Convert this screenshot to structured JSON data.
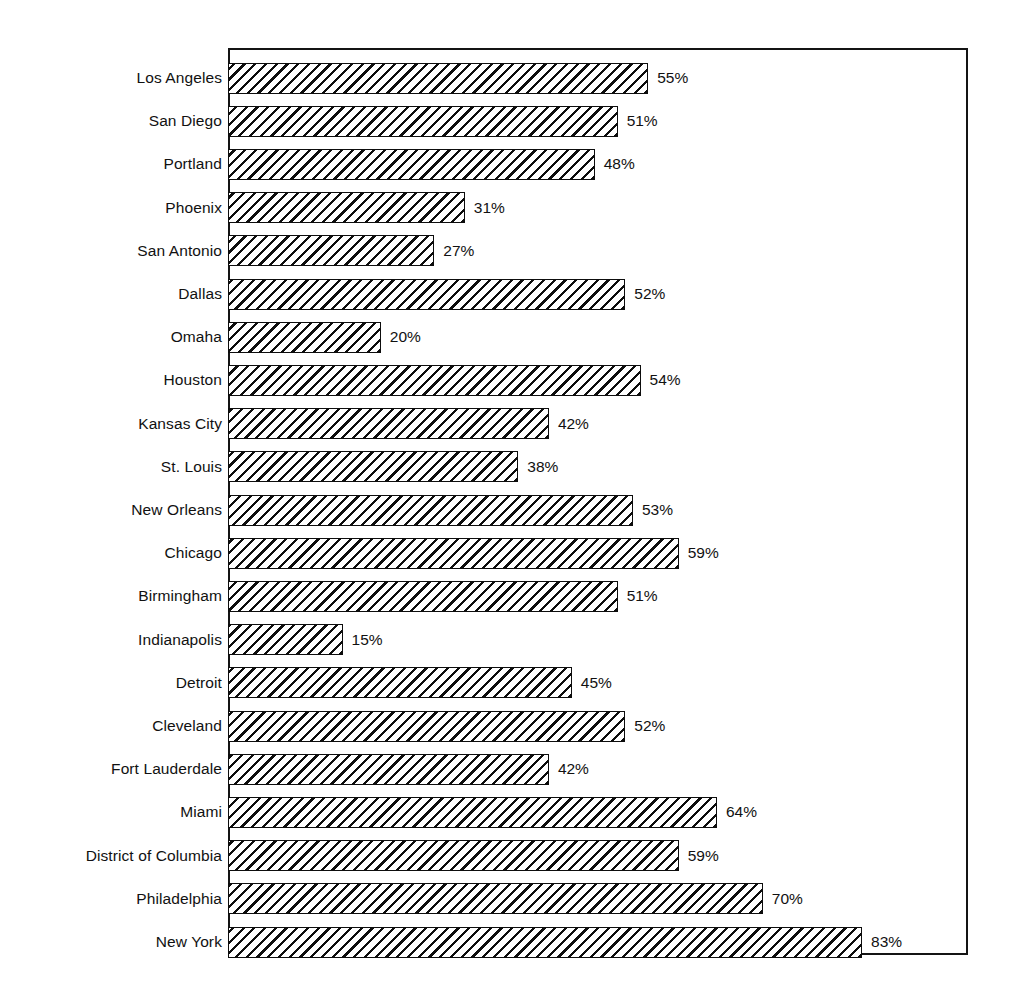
{
  "chart_data": {
    "type": "bar",
    "orientation": "horizontal",
    "title": "",
    "subtitle": "",
    "xlabel": "",
    "ylabel": "",
    "xlim": [
      0,
      100
    ],
    "grid": false,
    "legend": null,
    "value_suffix": "%",
    "categories": [
      "Los Angeles",
      "San Diego",
      "Portland",
      "Phoenix",
      "San Antonio",
      "Dallas",
      "Omaha",
      "Houston",
      "Kansas City",
      "St. Louis",
      "New Orleans",
      "Chicago",
      "Birmingham",
      "Indianapolis",
      "Detroit",
      "Cleveland",
      "Fort Lauderdale",
      "Miami",
      "District of Columbia",
      "Philadelphia",
      "New York"
    ],
    "values": [
      55,
      51,
      48,
      31,
      27,
      52,
      20,
      54,
      42,
      38,
      53,
      59,
      51,
      15,
      45,
      52,
      42,
      64,
      59,
      70,
      83
    ],
    "data_labels": [
      "55%",
      "51%",
      "48%",
      "31%",
      "27%",
      "52%",
      "20%",
      "54%",
      "42%",
      "38%",
      "53%",
      "59%",
      "51%",
      "15%",
      "45%",
      "52%",
      "42%",
      "64%",
      "59%",
      "70%",
      "83%"
    ],
    "bars": [
      {
        "label": "Los Angeles",
        "value": 55,
        "text": "55%"
      },
      {
        "label": "San Diego",
        "value": 51,
        "text": "51%"
      },
      {
        "label": "Portland",
        "value": 48,
        "text": "48%"
      },
      {
        "label": "Phoenix",
        "value": 31,
        "text": "31%"
      },
      {
        "label": "San Antonio",
        "value": 27,
        "text": "27%"
      },
      {
        "label": "Dallas",
        "value": 52,
        "text": "52%"
      },
      {
        "label": "Omaha",
        "value": 20,
        "text": "20%"
      },
      {
        "label": "Houston",
        "value": 54,
        "text": "54%"
      },
      {
        "label": "Kansas City",
        "value": 42,
        "text": "42%"
      },
      {
        "label": "St. Louis",
        "value": 38,
        "text": "38%"
      },
      {
        "label": "New Orleans",
        "value": 53,
        "text": "53%"
      },
      {
        "label": "Chicago",
        "value": 59,
        "text": "59%"
      },
      {
        "label": "Birmingham",
        "value": 51,
        "text": "51%"
      },
      {
        "label": "Indianapolis",
        "value": 15,
        "text": "15%"
      },
      {
        "label": "Detroit",
        "value": 45,
        "text": "45%"
      },
      {
        "label": "Cleveland",
        "value": 52,
        "text": "52%"
      },
      {
        "label": "Fort Lauderdale",
        "value": 42,
        "text": "42%"
      },
      {
        "label": "Miami",
        "value": 64,
        "text": "64%"
      },
      {
        "label": "District of Columbia",
        "value": 59,
        "text": "59%"
      },
      {
        "label": "Philadelphia",
        "value": 70,
        "text": "70%"
      },
      {
        "label": "New York",
        "value": 83,
        "text": "83%"
      }
    ],
    "colors": {
      "bar_fill": "#ffffff",
      "bar_edge": "#0d0d0d",
      "hatch": "#0d0d0d",
      "frame": "#141414",
      "text": "#111111",
      "background": "#ffffff"
    },
    "style": {
      "fill_pattern": "diagonal-hatch",
      "frame_visible": true
    }
  },
  "layout": {
    "plot_left_px": 228,
    "plot_top_px": 48,
    "plot_width_px": 740,
    "plot_height_px": 907,
    "px_per_unit": 7.64,
    "row_pitch_px": 43.2,
    "row_first_center_px": 30,
    "bar_height_px": 31
  }
}
